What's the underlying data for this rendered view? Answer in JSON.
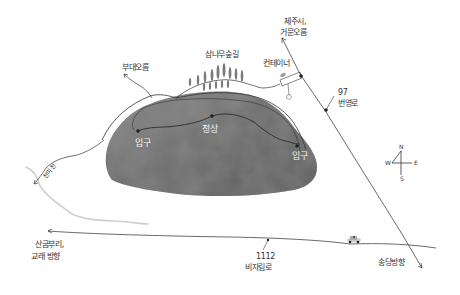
{
  "map": {
    "title": "",
    "style": "hand-drawn watercolor map",
    "colors": {
      "background": "#ffffff",
      "ink": "#333333",
      "crater": "#6e6e6e",
      "stream": "#c8c8c8"
    },
    "labels": {
      "budae_oreum": "부대오름",
      "cedar_trail": "삼나무숲길",
      "container": "컨테이너",
      "jeju_line1": "제주시,",
      "jeju_line2": "거문오름",
      "road97_line1": "97",
      "road97_line2": "번영로",
      "entrance_left": "입구",
      "summit": "정상",
      "entrance_right": "입구",
      "stream": "천미천",
      "sangumburi_line1": "산굼부리,",
      "sangumburi_line2": "교래 방향",
      "road1112_line1": "1112",
      "road1112_line2": "비자림로",
      "songdang": "송당방향"
    },
    "compass": {
      "north": "N",
      "south": "S",
      "east": "E",
      "west": "W"
    }
  }
}
